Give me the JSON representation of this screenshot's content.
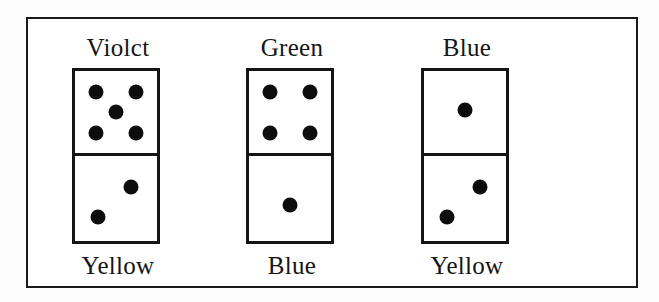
{
  "figure": {
    "caption_top_labels": [
      "Violct",
      "Green",
      "Blue"
    ],
    "caption_bottom_labels": [
      "Yellow",
      "Blue",
      "Yellow"
    ],
    "frame_color": "#1a1a1a",
    "pip_color": "#0d0d0d",
    "background_color": "#ffffff"
  },
  "dominoes": [
    {
      "top_label": "Violct",
      "bottom_label": "Yellow",
      "top_pips": 5,
      "bottom_pips": 2,
      "top_pip_layout": "quincunx",
      "bottom_pip_layout": "diagonal-upper-right-lower-left"
    },
    {
      "top_label": "Green",
      "bottom_label": "Blue",
      "top_pips": 4,
      "bottom_pips": 1,
      "top_pip_layout": "four-corners",
      "bottom_pip_layout": "center"
    },
    {
      "top_label": "Blue",
      "bottom_label": "Yellow",
      "top_pips": 1,
      "bottom_pips": 2,
      "top_pip_layout": "center",
      "bottom_pip_layout": "diagonal-upper-right-lower-left"
    }
  ]
}
